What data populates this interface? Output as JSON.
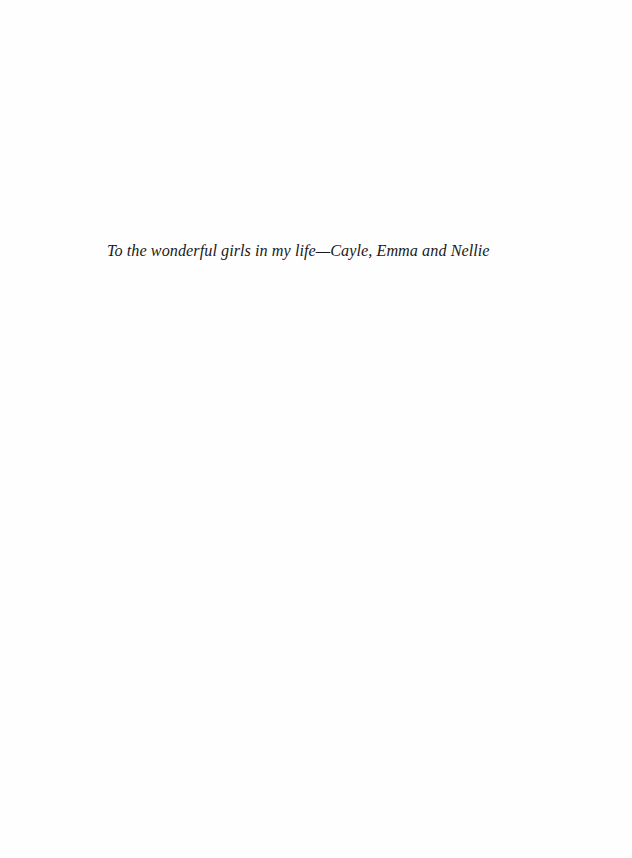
{
  "page": {
    "type": "dedication",
    "dedication_text": "To the wonderful girls in my life—Cayle, Emma and Nellie",
    "text_color": "#1a1a1a",
    "background_color": "#fefefe"
  }
}
